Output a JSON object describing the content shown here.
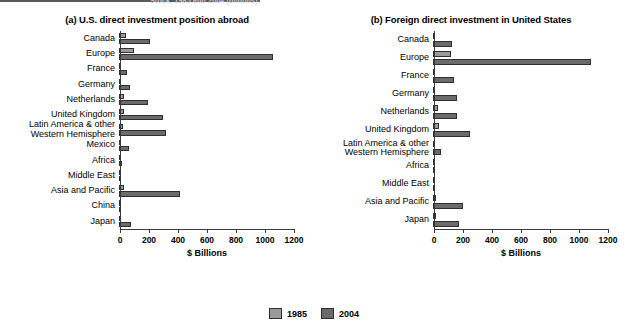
{
  "header": {
    "note": "Stock, 1985 and 2004 (billions)"
  },
  "legend": {
    "entries": [
      {
        "label": "1985",
        "color": "#9a9a9a"
      },
      {
        "label": "2004",
        "color": "#6b6b6b"
      }
    ]
  },
  "axis": {
    "title": "$ Billions",
    "ticks": [
      "0",
      "200",
      "400",
      "600",
      "800",
      "1000",
      "1200"
    ]
  },
  "chart_data": [
    {
      "type": "bar",
      "orientation": "horizontal",
      "title": "(a) U.S. direct investment position abroad",
      "panel": "a",
      "xlabel": "$ Billions",
      "ylabel": "",
      "xlim": [
        0,
        1200
      ],
      "grid": false,
      "legend_position": "bottom-center",
      "categories": [
        "Canada",
        "Europe",
        "France",
        "Germany",
        "Netherlands",
        "United Kingdom",
        "Latin America & other\nWestern Hemisphere",
        "Mexico",
        "Africa",
        "Middle East",
        "Asia and Pacific",
        "China",
        "Japan"
      ],
      "series": [
        {
          "name": "1985",
          "values": [
            47,
            105,
            7,
            17,
            37,
            33,
            28,
            5,
            6,
            4,
            35,
            1,
            9
          ]
        },
        {
          "name": "2004",
          "values": [
            216,
            1060,
            58,
            79,
            201,
            303,
            324,
            66,
            19,
            11,
            419,
            15,
            80
          ]
        }
      ]
    },
    {
      "type": "bar",
      "orientation": "horizontal",
      "title": "(b) Foreign direct investment in United States",
      "panel": "b",
      "xlabel": "$ Billions",
      "ylabel": "",
      "xlim": [
        0,
        1200
      ],
      "grid": false,
      "legend_position": "bottom-center",
      "categories": [
        "Canada",
        "Europe",
        "France",
        "Germany",
        "Netherlands",
        "United Kingdom",
        "Latin America & other\nWestern Hemisphere",
        "Africa",
        "Middle East",
        "Asia and Pacific",
        "Japan"
      ],
      "series": [
        {
          "name": "1985",
          "values": [
            17,
            122,
            8,
            15,
            37,
            43,
            15,
            1,
            5,
            20,
            19
          ]
        },
        {
          "name": "2004",
          "values": [
            134,
            1090,
            147,
            164,
            168,
            252,
            58,
            2,
            8,
            210,
            177
          ]
        }
      ]
    }
  ]
}
